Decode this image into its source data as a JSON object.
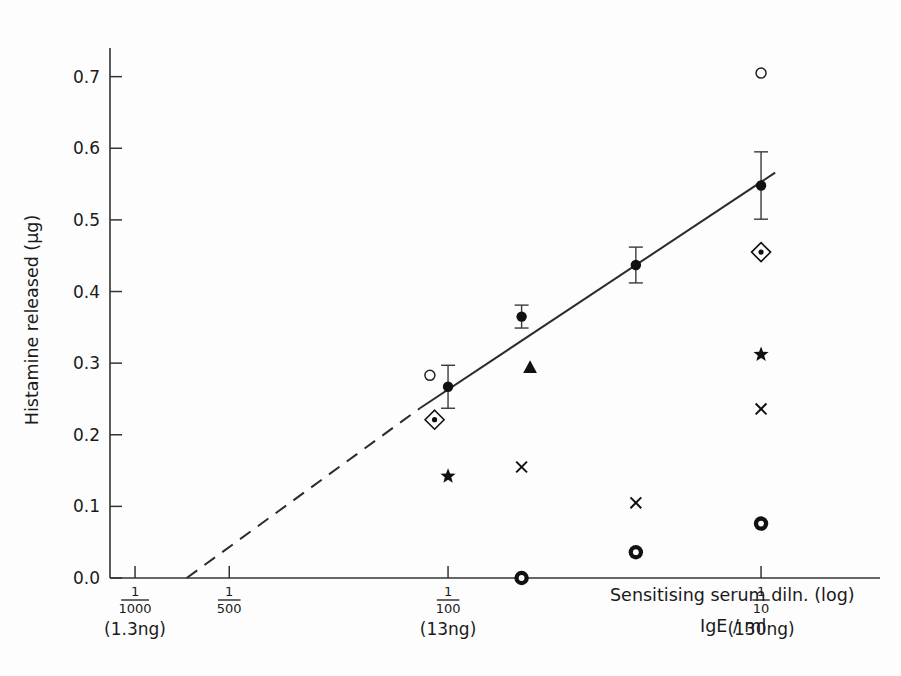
{
  "figure": {
    "background": "#fdfdfd",
    "ink_color": "#1a1a1a"
  },
  "chart_data": {
    "type": "scatter",
    "title": "",
    "xlabel": "Sensitising serum diln. (log)",
    "xlabel_secondary": "IgE / ml",
    "ylabel": "Histamine released  (µg)",
    "grid": false,
    "legend": "none",
    "ylim": [
      0.0,
      0.74
    ],
    "yticks": [
      "0.0",
      "0.1",
      "0.2",
      "0.3",
      "0.4",
      "0.5",
      "0.6",
      "0.7"
    ],
    "ytick_values": [
      0.0,
      0.1,
      0.2,
      0.3,
      0.4,
      0.5,
      0.6,
      0.7
    ],
    "xticks": [
      {
        "numerator": "1",
        "denominator": "1000",
        "ng": "(1.3ng)",
        "log_x": -3.0
      },
      {
        "numerator": "1",
        "denominator": "500",
        "ng": "",
        "log_x": -2.699
      },
      {
        "numerator": "1",
        "denominator": "100",
        "ng": "(13ng)",
        "log_x": -2.0
      },
      {
        "numerator": "1",
        "denominator": "10",
        "ng": "(130ng)",
        "log_x": -1.0
      }
    ],
    "xlim": [
      -3.08,
      -0.62
    ],
    "series": [
      {
        "name": "mean histamine release (filled circle, ±SE)",
        "marker": "filled-circle",
        "errorbars": true,
        "points": [
          {
            "log_x": -2.0,
            "y": 0.267,
            "yerr_low": 0.03,
            "yerr_high": 0.03
          },
          {
            "log_x": -1.765,
            "y": 0.365,
            "yerr_low": 0.016,
            "yerr_high": 0.016
          },
          {
            "log_x": -1.4,
            "y": 0.437,
            "yerr_low": 0.025,
            "yerr_high": 0.025
          },
          {
            "log_x": -1.0,
            "y": 0.548,
            "yerr_low": 0.047,
            "yerr_high": 0.047
          }
        ]
      },
      {
        "name": "open circle",
        "marker": "open-circle",
        "errorbars": false,
        "points": [
          {
            "log_x": -2.058,
            "y": 0.283
          },
          {
            "log_x": -1.0,
            "y": 0.705
          }
        ]
      },
      {
        "name": "dotted diamond",
        "marker": "dotted-diamond",
        "errorbars": false,
        "points": [
          {
            "log_x": -2.043,
            "y": 0.221
          },
          {
            "log_x": -1.0,
            "y": 0.455
          }
        ]
      },
      {
        "name": "filled star",
        "marker": "star",
        "errorbars": false,
        "points": [
          {
            "log_x": -2.0,
            "y": 0.142
          },
          {
            "log_x": -1.0,
            "y": 0.312
          }
        ]
      },
      {
        "name": "cross",
        "marker": "cross",
        "errorbars": false,
        "points": [
          {
            "log_x": -1.765,
            "y": 0.155
          },
          {
            "log_x": -1.4,
            "y": 0.105
          },
          {
            "log_x": -1.0,
            "y": 0.236
          }
        ]
      },
      {
        "name": "bullseye",
        "marker": "bullseye",
        "errorbars": false,
        "points": [
          {
            "log_x": -1.765,
            "y": 0.0
          },
          {
            "log_x": -1.4,
            "y": 0.036
          },
          {
            "log_x": -1.0,
            "y": 0.076
          }
        ]
      },
      {
        "name": "filled triangle",
        "marker": "triangle",
        "errorbars": false,
        "points": [
          {
            "log_x": -1.738,
            "y": 0.293
          }
        ]
      }
    ],
    "fit_line": {
      "style": "solid",
      "from": {
        "log_x": -2.09,
        "y": 0.237
      },
      "to": {
        "log_x": -0.955,
        "y": 0.566
      }
    },
    "fit_line_extrapolation": {
      "style": "dashed",
      "from": {
        "log_x": -2.835,
        "y": 0.0
      },
      "to": {
        "log_x": -2.09,
        "y": 0.237
      }
    }
  }
}
